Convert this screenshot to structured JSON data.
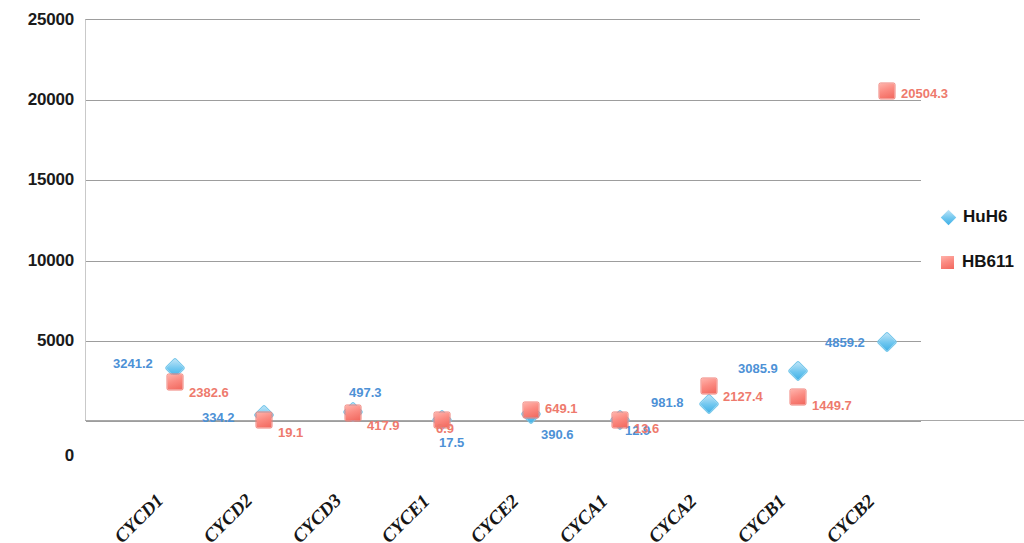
{
  "chart_data": {
    "type": "scatter",
    "title": "",
    "xlabel": "",
    "ylabel": "",
    "categories": [
      "CYCD1",
      "CYCD2",
      "CYCD3",
      "CYCE1",
      "CYCE2",
      "CYCA1",
      "CYCA2",
      "CYCB1",
      "CYCB2"
    ],
    "ylim": [
      0,
      25000
    ],
    "yticks": [
      0,
      5000,
      10000,
      15000,
      20000,
      25000
    ],
    "ytick_labels": [
      "0",
      "5000",
      "10000",
      "15000",
      "20000",
      "25000"
    ],
    "grid": true,
    "legend_position": "right",
    "series": [
      {
        "name": "HuH6",
        "color": "#6ec6ef",
        "label_color": "#4d91d6",
        "marker": "diamond",
        "values": [
          3241.2,
          334.2,
          497.3,
          17.5,
          390.6,
          12.9,
          981.8,
          3085.9,
          4859.2
        ],
        "value_labels": [
          "3241.2",
          "334.2",
          "497.3",
          "17.5",
          "390.6",
          "12.9",
          "981.8",
          "3085.9",
          "4859.2"
        ]
      },
      {
        "name": "HB611",
        "color": "#fb8b82",
        "label_color": "#ee7a6d",
        "marker": "square",
        "values": [
          2382.6,
          19.1,
          417.9,
          6.9,
          649.1,
          13.6,
          2127.4,
          1449.7,
          20504.3
        ],
        "value_labels": [
          "2382.6",
          "19.1",
          "417.9",
          "6.9",
          "649.1",
          "13.6",
          "2127.4",
          "1449.7",
          "20504.3"
        ]
      }
    ]
  },
  "legend": {
    "items": [
      {
        "label": "HuH6",
        "marker": "diamond-marker-icon"
      },
      {
        "label": "HB611",
        "marker": "square-marker-icon"
      }
    ]
  },
  "geometry": {
    "plot_left": 85,
    "plot_right": 920,
    "plot_top": 19,
    "plot_bottom": 420,
    "category_x": [
      175,
      264,
      353,
      442,
      531,
      620,
      709,
      798,
      887
    ],
    "label_offsets": {
      "HuH6": [
        [
          -62,
          -5
        ],
        [
          -62,
          2
        ],
        [
          -4,
          -20
        ],
        [
          -3,
          22
        ],
        [
          10,
          20
        ],
        [
          5,
          10
        ],
        [
          -58,
          -2
        ],
        [
          -60,
          -3
        ],
        [
          -62,
          0
        ]
      ],
      "HB611": [
        [
          14,
          10
        ],
        [
          14,
          12
        ],
        [
          14,
          12
        ],
        [
          -6,
          8
        ],
        [
          14,
          -2
        ],
        [
          14,
          8
        ],
        [
          14,
          10
        ],
        [
          14,
          8
        ],
        [
          14,
          2
        ]
      ]
    }
  }
}
